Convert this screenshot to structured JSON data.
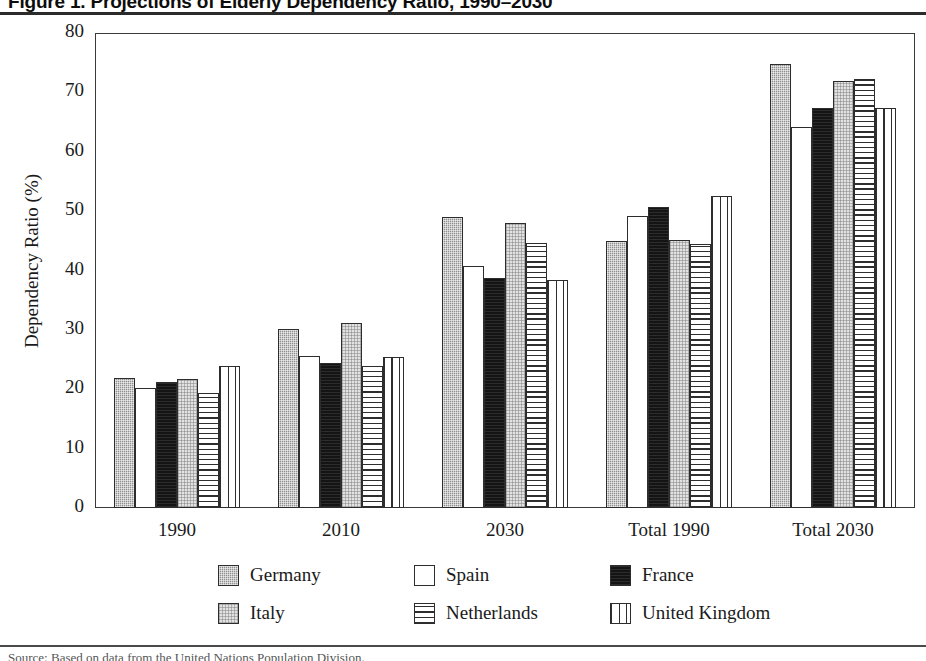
{
  "figure": {
    "title": "Figure 1. Projections of Elderly Dependency Ratio, 1990–2030",
    "source_note": "Source: Based on data from the United Nations Population Division."
  },
  "chart_data": {
    "type": "bar",
    "title": "Figure 1. Projections of Elderly Dependency Ratio, 1990–2030",
    "xlabel": "",
    "ylabel": "Dependency Ratio (%)",
    "ylim": [
      0,
      80
    ],
    "yticks": [
      "0",
      "10",
      "20",
      "30",
      "40",
      "50",
      "60",
      "70",
      "80"
    ],
    "ytick_values": [
      0,
      10,
      20,
      30,
      40,
      50,
      60,
      70,
      80
    ],
    "grid": false,
    "legend_position": "below",
    "categories": [
      "1990",
      "2010",
      "2030",
      "Total 1990",
      "Total 2030"
    ],
    "series": [
      {
        "name": "Germany",
        "pattern": "solid-dark-gray",
        "color": "#8f8f8f",
        "values": [
          21.9,
          30.2,
          49.0,
          44.9,
          74.8
        ]
      },
      {
        "name": "Spain",
        "pattern": "solid-white",
        "color": "#ffffff",
        "values": [
          20.2,
          25.6,
          40.7,
          49.2,
          64.1
        ]
      },
      {
        "name": "France",
        "pattern": "solid-black",
        "color": "#141414",
        "values": [
          21.2,
          24.5,
          38.8,
          50.7,
          67.4
        ]
      },
      {
        "name": "Italy",
        "pattern": "solid-light-gray",
        "color": "#e2e2e2",
        "values": [
          21.8,
          31.2,
          48.0,
          45.2,
          71.9
        ]
      },
      {
        "name": "Netherlands",
        "pattern": "horizontal-hatch",
        "color": "#ffffff",
        "values": [
          19.3,
          23.9,
          44.6,
          44.4,
          72.3
        ]
      },
      {
        "name": "United Kingdom",
        "pattern": "vertical-hatch",
        "color": "#ffffff",
        "values": [
          23.9,
          25.5,
          38.4,
          52.5,
          67.3
        ]
      }
    ]
  }
}
